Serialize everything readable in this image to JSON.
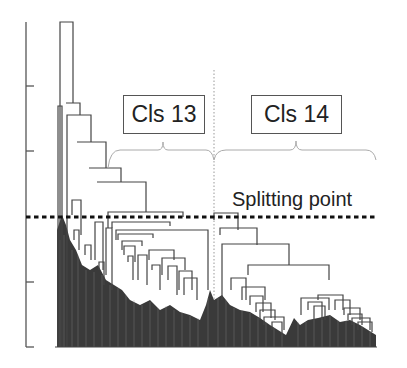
{
  "diagram": {
    "type": "dendrogram",
    "axis": {
      "y_axis_ticks_px": [
        22,
        86,
        151,
        216,
        282,
        347
      ],
      "tick_labels": []
    },
    "clusters": [
      {
        "label": "Cls 13",
        "box": {
          "x": 123,
          "y": 95,
          "w": 82,
          "h": 39
        },
        "brace": {
          "x1": 108,
          "x2": 214,
          "mid": 163,
          "y": 150
        }
      },
      {
        "label": "Cls 14",
        "box": {
          "x": 251,
          "y": 95,
          "w": 91,
          "h": 39
        },
        "brace": {
          "x1": 214,
          "x2": 376,
          "mid": 296,
          "y": 150
        }
      }
    ],
    "split": {
      "label": "Splitting point",
      "line_y": 217
    },
    "colors": {
      "line": "#444444",
      "dense_fill": "#3a3a3a",
      "brace": "#aaaaaa",
      "divider": "#999999"
    }
  }
}
